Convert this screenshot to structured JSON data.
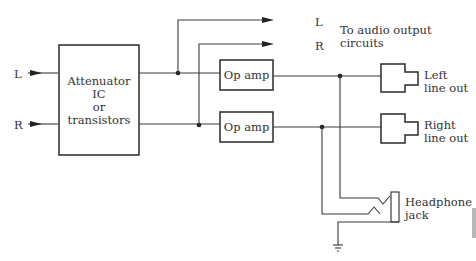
{
  "diagram": {
    "inputs": [
      {
        "label": "L"
      },
      {
        "label": "R"
      }
    ],
    "attenuator": {
      "lines": [
        "Attenuator",
        "IC",
        "or",
        "transistors"
      ]
    },
    "op_amps": [
      {
        "label": "Op amp"
      },
      {
        "label": "Op amp"
      }
    ],
    "audio_outputs": {
      "l_label": "L",
      "r_label": "R",
      "caption_lines": [
        "To audio output",
        "circuits"
      ]
    },
    "line_outs": [
      {
        "lines": [
          "Left",
          "line out"
        ]
      },
      {
        "lines": [
          "Right",
          "line out"
        ]
      }
    ],
    "headphone": {
      "lines": [
        "Headphone",
        "jack"
      ]
    },
    "ground_icon": "ground-symbol"
  }
}
